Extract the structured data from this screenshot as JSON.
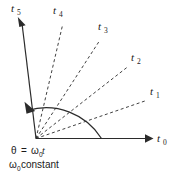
{
  "figure": {
    "background_color": "#ffffff",
    "line_color": "#2b2b2b",
    "text_color": "#1a1a1a"
  },
  "axes": {
    "horizontal": {
      "label_base": "t",
      "label_subscript": "0",
      "label_full": "t0",
      "style": "solid-with-arrow",
      "angle_degrees": 0
    }
  },
  "rays": [
    {
      "id": "ray-t1",
      "label_base": "t",
      "label_subscript": "1",
      "label_full": "t1",
      "style": "dashed",
      "angle_degrees": 19,
      "arrow": false
    },
    {
      "id": "ray-t2",
      "label_base": "t",
      "label_subscript": "2",
      "label_full": "t2",
      "style": "dashed",
      "angle_degrees": 38,
      "arrow": false
    },
    {
      "id": "ray-t3",
      "label_base": "t",
      "label_subscript": "3",
      "label_full": "t3",
      "style": "dashed",
      "angle_degrees": 57,
      "arrow": false
    },
    {
      "id": "ray-t4",
      "label_base": "t",
      "label_subscript": "4",
      "label_full": "t4",
      "style": "dashed",
      "angle_degrees": 76,
      "arrow": false
    },
    {
      "id": "ray-t5",
      "label_base": "t",
      "label_subscript": "5",
      "label_full": "t5",
      "style": "solid",
      "angle_degrees": 97,
      "arrow": true
    }
  ],
  "angle_arc": {
    "name": "theta-sweep-arc",
    "direction": "counterclockwise",
    "arrow_at": "end",
    "start_angle_degrees": 0,
    "end_angle_degrees": 97
  },
  "caption": {
    "line1": {
      "theta_symbol": "θ",
      "equals": "=",
      "omega_symbol": "ω",
      "omega_subscript": "0",
      "time_symbol": "t",
      "full": "θ = ω0t"
    },
    "line2": {
      "omega_symbol": "ω",
      "omega_subscript": "0",
      "word": "constant",
      "full": "ω0 constant"
    }
  }
}
